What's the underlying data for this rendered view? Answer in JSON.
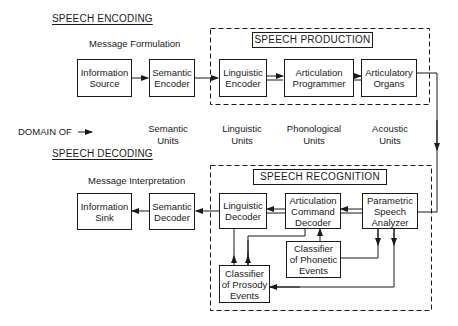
{
  "encoding": {
    "heading": "SPEECH ENCODING",
    "caption": "Message Formulation",
    "production_title": "SPEECH PRODUCTION",
    "blocks": [
      {
        "line1": "Information",
        "line2": "Source"
      },
      {
        "line1": "Semantic",
        "line2": "Encoder"
      },
      {
        "line1": "Linguistic",
        "line2": "Encoder"
      },
      {
        "line1": "Articulation",
        "line2": "Programmer"
      },
      {
        "line1": "Articulatory",
        "line2": "Organs"
      }
    ]
  },
  "domain_row": {
    "label": "DOMAIN OF",
    "arrow": "→",
    "units": [
      {
        "line1": "Semantic",
        "line2": "Units"
      },
      {
        "line1": "Linguistic",
        "line2": "Units"
      },
      {
        "line1": "Phonological",
        "line2": "Units"
      },
      {
        "line1": "Acoustic",
        "line2": "Units"
      }
    ]
  },
  "decoding": {
    "heading": "SPEECH DECODING",
    "caption": "Message Interpretation",
    "recognition_title": "SPEECH RECOGNITION",
    "blocks": [
      {
        "line1": "Information",
        "line2": "Sink"
      },
      {
        "line1": "Semantic",
        "line2": "Decoder"
      },
      {
        "line1": "Linguistic",
        "line2": "Decoder"
      },
      {
        "line1": "Articulation",
        "line2": "Command",
        "line3": "Decoder"
      },
      {
        "line1": "Parametric",
        "line2": "Speech",
        "line3": "Analyzer"
      },
      {
        "line1": "Classifier",
        "line2": "of Phonetic",
        "line3": "Events"
      },
      {
        "line1": "Classifier",
        "line2": "of Prosody",
        "line3": "Events"
      }
    ]
  }
}
